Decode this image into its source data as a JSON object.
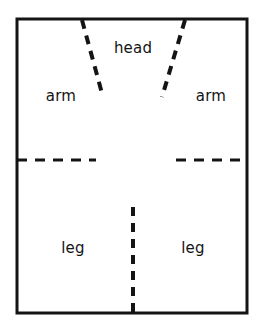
{
  "figure": {
    "background_color": "#ffffff",
    "ink_color": "#141414",
    "border": {
      "name": "outer-rectangle",
      "x": 17,
      "y": 19,
      "width": 230,
      "height": 294,
      "stroke_width": 3,
      "style": "solid"
    },
    "labels": [
      {
        "id": "head",
        "text": "head",
        "x": 133,
        "y": 48
      },
      {
        "id": "arm-left",
        "text": "arm",
        "x": 61,
        "y": 96
      },
      {
        "id": "arm-right",
        "text": "arm",
        "x": 211,
        "y": 96
      },
      {
        "id": "leg-left",
        "text": "leg",
        "x": 73,
        "y": 248
      },
      {
        "id": "leg-right",
        "text": "leg",
        "x": 193,
        "y": 248
      }
    ],
    "dividers": [
      {
        "id": "head-arm-divider-left",
        "name": "diagonal-dashed-line-left",
        "orientation": "diagonal",
        "x1": 82,
        "y1": 20,
        "x2": 103,
        "y2": 97,
        "stroke_width": 4,
        "dash": "9 7"
      },
      {
        "id": "head-arm-divider-right",
        "name": "diagonal-dashed-line-right",
        "orientation": "diagonal",
        "x1": 185,
        "y1": 20,
        "x2": 162,
        "y2": 97,
        "stroke_width": 4,
        "dash": "9 7"
      },
      {
        "id": "arm-leg-divider-left",
        "name": "horizontal-dashed-line-left",
        "orientation": "horizontal",
        "x1": 17,
        "y1": 160,
        "x2": 96,
        "y2": 160,
        "stroke_width": 3,
        "dash": "10 8"
      },
      {
        "id": "arm-leg-divider-right",
        "name": "horizontal-dashed-line-right",
        "orientation": "horizontal",
        "x1": 176,
        "y1": 160,
        "x2": 247,
        "y2": 160,
        "stroke_width": 3,
        "dash": "10 8"
      },
      {
        "id": "leg-leg-divider",
        "name": "vertical-dashed-line-center",
        "orientation": "vertical",
        "x1": 133,
        "y1": 207,
        "x2": 133,
        "y2": 313,
        "stroke_width": 4,
        "dash": "9 7"
      }
    ]
  }
}
